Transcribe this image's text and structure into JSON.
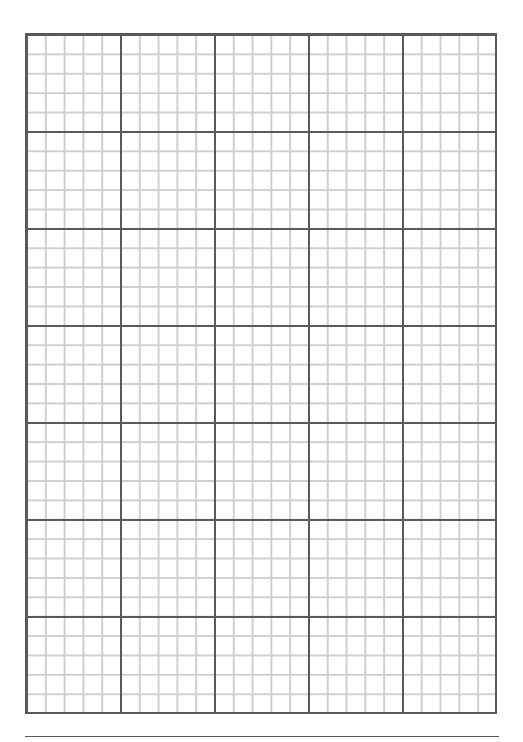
{
  "page": {
    "type": "graph-paper",
    "major_columns": 5,
    "major_rows": 7,
    "minor_divisions_per_major": 5,
    "colors": {
      "major_line": "#5a5a5a",
      "minor_line": "#cfcfcf",
      "background": "#ffffff"
    }
  }
}
